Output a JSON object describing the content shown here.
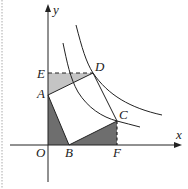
{
  "diagram": {
    "type": "coordinate-geometry",
    "axes": {
      "x_label": "x",
      "y_label": "y",
      "origin_label": "O"
    },
    "points": {
      "O": {
        "label": "O",
        "x": 48,
        "y": 145
      },
      "A": {
        "label": "A",
        "x": 48,
        "y": 95
      },
      "B": {
        "label": "B",
        "x": 69,
        "y": 145
      },
      "C": {
        "label": "C",
        "x": 117,
        "y": 121
      },
      "D": {
        "label": "D",
        "x": 93,
        "y": 73
      },
      "E": {
        "label": "E",
        "x": 48,
        "y": 73
      },
      "F": {
        "label": "F",
        "x": 117,
        "y": 145
      }
    },
    "shapes": {
      "square": "ABCD",
      "shaded_dark": [
        "AOB",
        "BFC"
      ],
      "shaded_light": [
        "AED"
      ],
      "dashed_segments": [
        "ED",
        "CF"
      ]
    },
    "curves": [
      {
        "name": "outer-hyperbola",
        "through": "D"
      },
      {
        "name": "inner-hyperbola",
        "through": "C"
      }
    ],
    "colors": {
      "line": "#222222",
      "shade_dark": "#6e6e6e",
      "shade_light": "#c4c4c4",
      "border_dotted": "#aaaaaa"
    }
  }
}
